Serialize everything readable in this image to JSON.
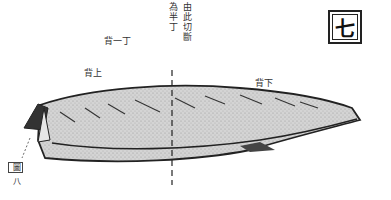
{
  "figure": {
    "number_badge": "七",
    "caption_figure": "圖",
    "caption_number": "八"
  },
  "labels": {
    "cut_note_right": "由此切斷",
    "cut_note_left": "為半丁",
    "back_one_cho": "背一丁",
    "back_upper": "背上",
    "back_lower": "背下"
  },
  "colors": {
    "ink": "#222222",
    "fill": "#c8c8c8",
    "paper": "#ffffff"
  }
}
